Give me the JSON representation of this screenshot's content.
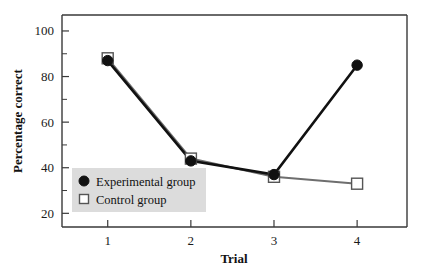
{
  "chart_data": {
    "type": "line",
    "title": "",
    "xlabel": "Trial",
    "ylabel": "Percentage correct",
    "categories": [
      1,
      2,
      3,
      4
    ],
    "x": [
      1,
      2,
      3,
      4
    ],
    "xlim": [
      0.45,
      4.6
    ],
    "ylim": [
      14,
      107
    ],
    "xticks": [
      1,
      2,
      3,
      4
    ],
    "xtick_labels": [
      "1",
      "2",
      "3",
      "4"
    ],
    "yticks": [
      20,
      40,
      60,
      80,
      100
    ],
    "ytick_labels": [
      "20",
      "40",
      "60",
      "80",
      "100"
    ],
    "yticks_minor": [
      30,
      50,
      70,
      90
    ],
    "grid": false,
    "legend_position": "lower left",
    "series": [
      {
        "name": "Experimental group",
        "marker": "filled-circle",
        "color": "#111111",
        "values": [
          87,
          43,
          37,
          85
        ]
      },
      {
        "name": "Control group",
        "marker": "open-square",
        "color": "#6e6e6e",
        "values": [
          88,
          44,
          36,
          33
        ]
      }
    ]
  },
  "legend": {
    "items": [
      {
        "label": "Experimental group",
        "marker": "filled-circle"
      },
      {
        "label": "Control group",
        "marker": "open-square"
      }
    ]
  },
  "colors": {
    "experimental": "#111111",
    "control": "#6e6e6e",
    "axis": "#3a3a3a",
    "legend_background": "#dcdcdc",
    "page_background": "#ffffff"
  }
}
